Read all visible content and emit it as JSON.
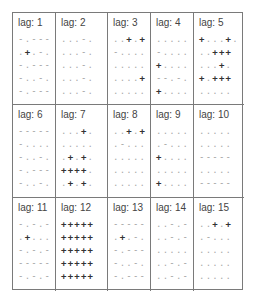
{
  "matrix": {
    "legend": {
      "plus": "+",
      "minus": "-",
      "dot": "."
    },
    "lags": [
      {
        "label": "lag:  1",
        "rows": [
          "-.---",
          ".+.-.",
          "-.---",
          "-..-.",
          "-.---"
        ]
      },
      {
        "label": "lag:  2",
        "rows": [
          "...-.",
          "...-.",
          "...-.",
          "...-.",
          "...-."
        ]
      },
      {
        "label": "lag:  3",
        "rows": [
          "..+.+",
          "-....",
          ".....",
          "....+",
          "....."
        ]
      },
      {
        "label": "lag:  4",
        "rows": [
          ".....",
          "-....",
          "+....",
          "--.-.",
          "+...."
        ]
      },
      {
        "label": "lag:  5",
        "rows": [
          "+...+.",
          "..+++",
          "...+.",
          "+.+++",
          "....."
        ]
      },
      {
        "label": "lag:  6",
        "rows": [
          "-----",
          "-....",
          "-..-.",
          "-.---",
          "-..-."
        ]
      },
      {
        "label": "lag:  7",
        "rows": [
          "...+.",
          ".....",
          ".+.+.",
          "++++.",
          ".+.+."
        ]
      },
      {
        "label": "lag:  8",
        "rows": [
          "..+.+",
          ".-...",
          ".....",
          ".....",
          "....."
        ]
      },
      {
        "label": "lag:  9",
        "rows": [
          ".....",
          ".-...",
          "+....",
          ".....",
          "+...."
        ]
      },
      {
        "label": "lag:  10",
        "rows": [
          ".....",
          ".....",
          "-----",
          ".....",
          "-----"
        ]
      },
      {
        "label": "lag:  11",
        "rows": [
          "-.-.-",
          ".+...",
          "-.-.-",
          "-----",
          "-.-.-"
        ]
      },
      {
        "label": "lag:  12",
        "rows": [
          "+++++",
          "+++++",
          "+++++",
          "+++++",
          "+++++"
        ]
      },
      {
        "label": "lag:  13",
        "rows": [
          "-----",
          ".+.-.",
          "-.---",
          "-..-.",
          "-.---"
        ]
      },
      {
        "label": "lag:  14",
        "rows": [
          "..-.-",
          "..-.-",
          ".....",
          "..-.-",
          "..-.-"
        ]
      },
      {
        "label": "lag:  15",
        "rows": [
          "..+.+",
          ".-...",
          ".....",
          ".....",
          "....."
        ]
      }
    ]
  }
}
